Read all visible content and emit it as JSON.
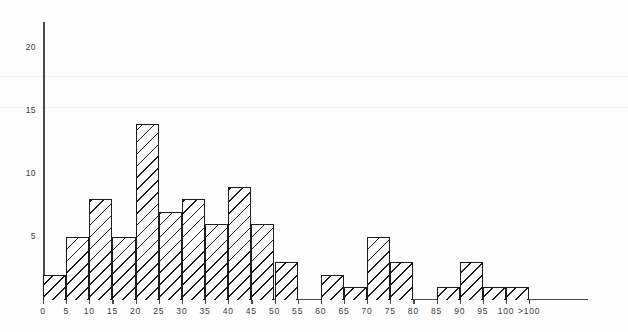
{
  "chart_data": {
    "type": "bar",
    "title": "",
    "subtitle": "",
    "xlabel": "",
    "ylabel": "",
    "grid": false,
    "legend": null,
    "xlim": [
      0,
      105
    ],
    "ylim": [
      0,
      22
    ],
    "x_tick_labels": [
      "0",
      "5",
      "10",
      "15",
      "20",
      "25",
      "30",
      "35",
      "40",
      "45",
      "50",
      "55",
      "60",
      "65",
      "70",
      "75",
      "80",
      "85",
      "90",
      "95",
      "100",
      "&gt;100"
    ],
    "x_tick_values": [
      0,
      5,
      10,
      15,
      20,
      25,
      30,
      35,
      40,
      45,
      50,
      55,
      60,
      65,
      70,
      75,
      80,
      85,
      90,
      95,
      100,
      105
    ],
    "y_tick_labels": [
      "5",
      "10",
      "15",
      "20"
    ],
    "y_tick_values": [
      5,
      10,
      15,
      20
    ],
    "bin_width": 5,
    "categories": [
      "0-5",
      "5-10",
      "10-15",
      "15-20",
      "20-25",
      "25-30",
      "30-35",
      "35-40",
      "40-45",
      "45-50",
      "50-55",
      "55-60",
      "60-65",
      "65-70",
      "70-75",
      "75-80",
      "80-85",
      "85-90",
      "90-95",
      "95-100",
      "100+"
    ],
    "bin_starts": [
      0,
      5,
      10,
      15,
      20,
      25,
      30,
      35,
      40,
      45,
      50,
      55,
      60,
      65,
      70,
      75,
      80,
      85,
      90,
      95,
      100
    ],
    "values": [
      2,
      5,
      8,
      5,
      14,
      7,
      8,
      6,
      9,
      6,
      3,
      0,
      2,
      1,
      5,
      3,
      0,
      1,
      3,
      1,
      1
    ],
    "series": [
      {
        "name": "frequency",
        "values": [
          2,
          5,
          8,
          5,
          14,
          7,
          8,
          6,
          9,
          6,
          3,
          0,
          2,
          1,
          5,
          3,
          0,
          1,
          3,
          1,
          1
        ]
      }
    ],
    "style": {
      "bar_fill": "hatched-diagonal",
      "bar_edge_color": "#1c1c1c",
      "bar_face_color": "#ffffff",
      "axis_color": "#4a4a4a",
      "background": "#ffffff"
    }
  }
}
